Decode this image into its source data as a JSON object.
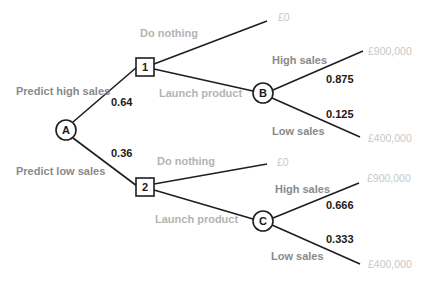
{
  "diagram": {
    "type": "decision-tree",
    "nodes": {
      "A": {
        "label": "A",
        "shape": "circle"
      },
      "n1": {
        "label": "1",
        "shape": "square"
      },
      "n2": {
        "label": "2",
        "shape": "square"
      },
      "B": {
        "label": "B",
        "shape": "circle"
      },
      "C": {
        "label": "C",
        "shape": "circle"
      }
    },
    "branches": {
      "predict_high": {
        "label": "Predict high sales",
        "probability": "0.64"
      },
      "predict_low": {
        "label": "Predict low sales",
        "probability": "0.36"
      },
      "n1_do_nothing": {
        "label": "Do nothing",
        "payoff": "£0"
      },
      "n1_launch": {
        "label": "Launch product"
      },
      "n2_do_nothing": {
        "label": "Do nothing",
        "payoff": "£0"
      },
      "n2_launch": {
        "label": "Launch product"
      },
      "B_high": {
        "label": "High sales",
        "probability": "0.875",
        "payoff": "£900,000"
      },
      "B_low": {
        "label": "Low sales",
        "probability": "0.125",
        "payoff": "£400,000"
      },
      "C_high": {
        "label": "High sales",
        "probability": "0.666",
        "payoff": "£900,000"
      },
      "C_low": {
        "label": "Low sales",
        "probability": "0.333",
        "payoff": "£400,000"
      }
    }
  }
}
